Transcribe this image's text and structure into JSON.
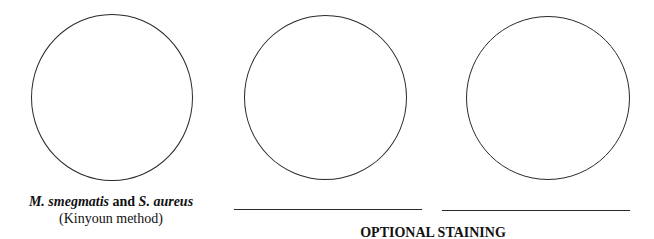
{
  "panels": [
    {
      "id": "panel-1",
      "caption": {
        "organism_1": "M. smegmatis",
        "conjunction": " and ",
        "organism_2": "S. aureus",
        "method": "(Kinyoun method)"
      }
    },
    {
      "id": "panel-2",
      "label_line": ""
    },
    {
      "id": "panel-3",
      "label_line": ""
    }
  ],
  "footer": {
    "title": "OPTIONAL STAINING"
  }
}
